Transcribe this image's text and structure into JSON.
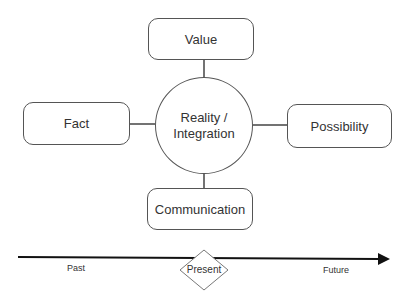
{
  "diagram": {
    "center": {
      "line1": "Reality /",
      "line2": "Integration"
    },
    "nodes": {
      "top": "Value",
      "left": "Fact",
      "right": "Possibility",
      "bottom": "Communication"
    },
    "timeline": {
      "past": "Past",
      "present": "Present",
      "future": "Future"
    },
    "colors": {
      "stroke": "#555555",
      "arrow": "#111111",
      "text": "#333333"
    }
  }
}
